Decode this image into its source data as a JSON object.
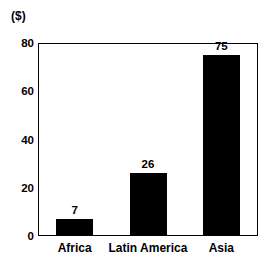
{
  "chart_data": {
    "type": "bar",
    "title": "",
    "subtitle": "",
    "unit_label": "($)",
    "xlabel": "",
    "ylabel": "",
    "categories": [
      "Africa",
      "Latin America",
      "Asia"
    ],
    "values": [
      7,
      26,
      75
    ],
    "value_labels": [
      "7",
      "26",
      "75"
    ],
    "ylim": [
      0,
      80
    ],
    "yticks": [
      0,
      20,
      40,
      60,
      80
    ],
    "ytick_labels": [
      "0",
      "20",
      "40",
      "60",
      "80"
    ],
    "grid": false,
    "legend": null,
    "bar_color": "#000000",
    "frame_color": "#000000",
    "background_color": "#ffffff"
  }
}
